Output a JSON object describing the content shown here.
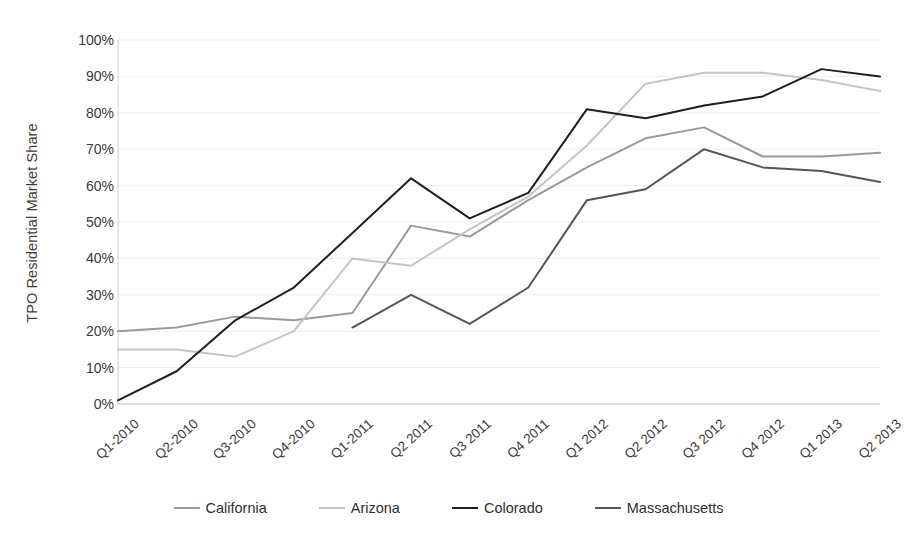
{
  "chart_data": {
    "type": "line",
    "title": "",
    "xlabel": "",
    "ylabel": "TPO Residential Market Share",
    "ylim": [
      0,
      100
    ],
    "ytick_labels": [
      "0%",
      "10%",
      "20%",
      "30%",
      "40%",
      "50%",
      "60%",
      "70%",
      "80%",
      "90%",
      "100%"
    ],
    "ytick_values": [
      0,
      10,
      20,
      30,
      40,
      50,
      60,
      70,
      80,
      90,
      100
    ],
    "grid": "horizontal",
    "legend_position": "bottom",
    "categories": [
      "Q1-2010",
      "Q2-2010",
      "Q3-2010",
      "Q4-2010",
      "Q1-2011",
      "Q2 2011",
      "Q3 2011",
      "Q4 2011",
      "Q1 2012",
      "Q2 2012",
      "Q3 2012",
      "Q4 2012",
      "Q1 2013",
      "Q2 2013"
    ],
    "series": [
      {
        "name": "California",
        "color": "#9a9a9a",
        "values": [
          20,
          21,
          24,
          23,
          25,
          49,
          46,
          56,
          65,
          73,
          76,
          68,
          68,
          69
        ]
      },
      {
        "name": "Arizona",
        "color": "#c4c4c4",
        "values": [
          15,
          15,
          13,
          20,
          40,
          38,
          48,
          57,
          71,
          88,
          91,
          91,
          89,
          86
        ]
      },
      {
        "name": "Colorado",
        "color": "#1f1f1f",
        "values": [
          1,
          9,
          23,
          32,
          47,
          62,
          51,
          58,
          81,
          78.5,
          82,
          84.5,
          92,
          90
        ]
      },
      {
        "name": "Massachusetts",
        "color": "#555555",
        "values": [
          null,
          null,
          null,
          null,
          21,
          30,
          22,
          32,
          56,
          59,
          70,
          65,
          64,
          61
        ]
      }
    ]
  },
  "legend": {
    "items": [
      {
        "label": "California"
      },
      {
        "label": "Arizona"
      },
      {
        "label": "Colorado"
      },
      {
        "label": "Massachusetts"
      }
    ]
  }
}
